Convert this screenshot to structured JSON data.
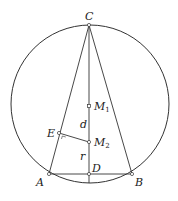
{
  "diagram": {
    "type": "geometry",
    "circle": {
      "cx": 90,
      "cy": 104,
      "r": 79,
      "stroke": "#333333"
    },
    "points": {
      "C": {
        "x": 89,
        "y": 25,
        "label": "C"
      },
      "A": {
        "x": 49,
        "y": 174,
        "label": "A"
      },
      "B": {
        "x": 132,
        "y": 174,
        "label": "B"
      },
      "D": {
        "x": 89,
        "y": 174,
        "label": "D"
      },
      "E": {
        "x": 59,
        "y": 133,
        "label": "E"
      },
      "M1": {
        "x": 89,
        "y": 106,
        "label": "M",
        "sub": "1"
      },
      "M2": {
        "x": 89,
        "y": 142,
        "label": "M",
        "sub": "2"
      }
    },
    "segment_labels": {
      "d": "d",
      "r": "r"
    },
    "segments": [
      "CA",
      "CB",
      "AB",
      "CD (extended to circle)",
      "EM2"
    ],
    "right_angle_at": "E"
  }
}
